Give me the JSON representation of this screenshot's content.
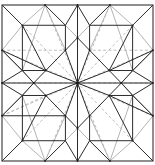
{
  "diagram": {
    "type": "origami-crease-pattern",
    "frame": {
      "x0": 2,
      "y0": 5,
      "x1": 153,
      "y1": 161
    },
    "colors": {
      "dark": "#2b2b2b",
      "light": "#b4b4b4",
      "dashed": "#b8b8b8",
      "background": "#ffffff"
    },
    "points": {
      "C": [
        0.5,
        0.5
      ],
      "T1": [
        0.285,
        0
      ],
      "T2": [
        0.5,
        0
      ],
      "T3": [
        0.715,
        0
      ],
      "B1": [
        0.285,
        1
      ],
      "B2": [
        0.5,
        1
      ],
      "B3": [
        0.715,
        1
      ],
      "L1": [
        0,
        0.29
      ],
      "L2": [
        0,
        0.5
      ],
      "L3": [
        0,
        0.71
      ],
      "R1": [
        1,
        0.29
      ],
      "R2": [
        1,
        0.5
      ],
      "R3": [
        1,
        0.71
      ],
      "Q1": [
        0.135,
        0.13
      ],
      "Q2": [
        0.865,
        0.13
      ],
      "Q3": [
        0.865,
        0.87
      ],
      "Q4": [
        0.135,
        0.87
      ],
      "O1": [
        0.42,
        0.29
      ],
      "O2": [
        0.58,
        0.29
      ],
      "O3": [
        0.71,
        0.42
      ],
      "O4": [
        0.71,
        0.58
      ],
      "O5": [
        0.58,
        0.71
      ],
      "O6": [
        0.42,
        0.71
      ],
      "O7": [
        0.29,
        0.58
      ],
      "O8": [
        0.29,
        0.42
      ],
      "A1": [
        0.5,
        0.21
      ],
      "A2": [
        0.79,
        0.5
      ],
      "A3": [
        0.5,
        0.79
      ],
      "A4": [
        0.21,
        0.5
      ],
      "S1": [
        0.42,
        0.13
      ],
      "S2": [
        0.58,
        0.13
      ],
      "S3": [
        0.865,
        0.42
      ],
      "S4": [
        0.865,
        0.58
      ],
      "S5": [
        0.58,
        0.87
      ],
      "S6": [
        0.42,
        0.87
      ],
      "S7": [
        0.135,
        0.58
      ],
      "S8": [
        0.135,
        0.42
      ]
    },
    "dark_lines": [
      [
        "Q1",
        "S1"
      ],
      [
        "S1",
        "O1"
      ],
      [
        "Q1",
        "S8"
      ],
      [
        "S8",
        "O8"
      ],
      [
        "Q2",
        "S2"
      ],
      [
        "S2",
        "O2"
      ],
      [
        "Q2",
        "S3"
      ],
      [
        "S3",
        "O3"
      ],
      [
        "Q3",
        "S4"
      ],
      [
        "S4",
        "O4"
      ],
      [
        "Q3",
        "S5"
      ],
      [
        "S5",
        "O5"
      ],
      [
        "Q4",
        "S6"
      ],
      [
        "S6",
        "O6"
      ],
      [
        "Q4",
        "S7"
      ],
      [
        "S7",
        "O7"
      ],
      [
        "O1",
        "O8"
      ],
      [
        "O2",
        "O3"
      ],
      [
        "O4",
        "O5"
      ],
      [
        "O6",
        "O7"
      ],
      [
        "C",
        "O1"
      ],
      [
        "C",
        "O2"
      ],
      [
        "C",
        "O3"
      ],
      [
        "C",
        "O4"
      ],
      [
        "C",
        "O5"
      ],
      [
        "C",
        "O6"
      ],
      [
        "C",
        "O7"
      ],
      [
        "C",
        "O8"
      ],
      [
        "C",
        "A1"
      ],
      [
        "C",
        "A2"
      ],
      [
        "C",
        "A3"
      ],
      [
        "C",
        "A4"
      ],
      [
        "T2",
        "A1"
      ],
      [
        "B2",
        "A3"
      ],
      [
        "L2",
        "A4"
      ],
      [
        "R2",
        "A2"
      ],
      [
        "T1",
        "S1"
      ],
      [
        "T3",
        "S2"
      ],
      [
        "B1",
        "S6"
      ],
      [
        "B3",
        "S5"
      ],
      [
        "L1",
        "S8"
      ],
      [
        "L3",
        "S7"
      ],
      [
        "R1",
        "S3"
      ],
      [
        "R3",
        "S4"
      ],
      [
        "T2",
        "S1"
      ],
      [
        "T2",
        "S2"
      ],
      [
        "B2",
        "S5"
      ],
      [
        "B2",
        "S6"
      ],
      [
        "L2",
        "S7"
      ],
      [
        "L2",
        "S8"
      ],
      [
        "R2",
        "S3"
      ],
      [
        "R2",
        "S4"
      ],
      [
        "A1",
        "O1"
      ],
      [
        "A1",
        "O2"
      ],
      [
        "A2",
        "O3"
      ],
      [
        "A2",
        "O4"
      ],
      [
        "A3",
        "O5"
      ],
      [
        "A3",
        "O6"
      ],
      [
        "A4",
        "O7"
      ],
      [
        "A4",
        "O8"
      ],
      [
        "Q1",
        "O8"
      ],
      [
        "Q2",
        "O3"
      ],
      [
        "Q3",
        "O4"
      ],
      [
        "Q4",
        "O7"
      ],
      [
        "corner_tl",
        "Q1"
      ],
      [
        "corner_tr",
        "Q2"
      ],
      [
        "corner_br",
        "Q3"
      ],
      [
        "corner_bl",
        "Q4"
      ],
      [
        "L1",
        "O8"
      ],
      [
        "R1",
        "O3"
      ],
      [
        "L3",
        "O6"
      ],
      [
        "R3",
        "O4"
      ],
      [
        "S8",
        "A4"
      ],
      [
        "S3",
        "A2"
      ],
      [
        "S7",
        "A4"
      ],
      [
        "S4",
        "A2"
      ]
    ],
    "light_lines": [
      [
        "T1",
        "Q1"
      ],
      [
        "T3",
        "Q2"
      ],
      [
        "B1",
        "Q4"
      ],
      [
        "B3",
        "Q3"
      ],
      [
        "L1",
        "Q1"
      ],
      [
        "R1",
        "Q2"
      ],
      [
        "L3",
        "Q4"
      ],
      [
        "R3",
        "Q3"
      ],
      [
        "T1",
        "O1"
      ],
      [
        "T3",
        "O2"
      ],
      [
        "B1",
        "O6"
      ],
      [
        "B3",
        "O5"
      ],
      [
        "L1",
        "A4"
      ],
      [
        "R1",
        "A2"
      ],
      [
        "L3",
        "A4"
      ],
      [
        "R3",
        "A2"
      ],
      [
        "S1",
        "A1"
      ],
      [
        "S2",
        "A1"
      ],
      [
        "S5",
        "A3"
      ],
      [
        "S6",
        "A3"
      ],
      [
        "T1",
        "S8"
      ],
      [
        "T3",
        "S3"
      ],
      [
        "B1",
        "S7"
      ],
      [
        "B3",
        "S4"
      ]
    ],
    "dashed_lines": [
      [
        "T2",
        "C"
      ],
      [
        "B2",
        "C"
      ],
      [
        "L2",
        "C"
      ],
      [
        "R2",
        "C"
      ],
      [
        "T1",
        "C"
      ],
      [
        "T3",
        "C"
      ],
      [
        "B1",
        "C"
      ],
      [
        "B3",
        "C"
      ],
      [
        "L1",
        "C"
      ],
      [
        "R1",
        "C"
      ],
      [
        "L3",
        "C"
      ],
      [
        "R3",
        "C"
      ],
      [
        "Q1",
        "C"
      ],
      [
        "Q2",
        "C"
      ],
      [
        "Q3",
        "C"
      ],
      [
        "Q4",
        "C"
      ],
      [
        "L1",
        "O1"
      ],
      [
        "R1",
        "O2"
      ],
      [
        "L3",
        "O7"
      ],
      [
        "R3",
        "O4"
      ]
    ],
    "nodes": [
      "C",
      "T2",
      "B2",
      "L2",
      "R2",
      "Q1",
      "Q2",
      "Q3",
      "Q4",
      "O1",
      "O2",
      "O3",
      "O4",
      "O5",
      "O6",
      "O7",
      "O8",
      "A1",
      "A2",
      "A3",
      "A4",
      "T1",
      "T3",
      "B1",
      "B3",
      "L1",
      "L3",
      "R1",
      "R3"
    ]
  }
}
